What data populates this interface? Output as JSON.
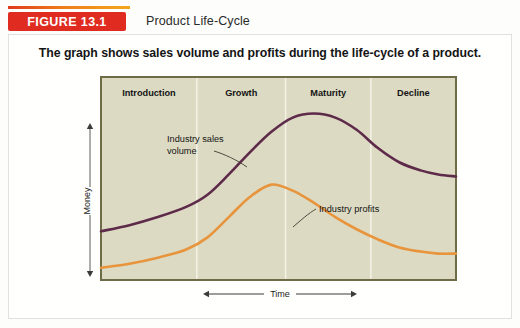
{
  "header": {
    "badge_label": "FIGURE 13.1",
    "title": "Product Life-Cycle",
    "badge_color": "#e02b20",
    "rule_color": "#ef7d1a"
  },
  "caption": "The graph shows sales volume and profits during the life-cycle of a product.",
  "axes": {
    "y_label": "Money",
    "x_label": "Time"
  },
  "annotations": {
    "sales_line1": "Industry sales",
    "sales_line2": "volume",
    "profits": "Industry profits"
  },
  "chart_data": {
    "type": "line",
    "title": "Product Life-Cycle",
    "subtitle": "The graph shows sales volume and profits during the life-cycle of a product.",
    "xlabel": "Time",
    "ylabel": "Money",
    "grid": false,
    "legend": "annotated-inline",
    "plot_background": "#dcdac2",
    "plot_border": "#6f6b46",
    "divider_color": "#f2f1e3",
    "xlim": [
      0,
      100
    ],
    "ylim": [
      0,
      100
    ],
    "stages": [
      {
        "label": "Introduction",
        "x_start": 0,
        "x_end": 27,
        "center": 13.5
      },
      {
        "label": "Growth",
        "x_start": 27,
        "x_end": 52,
        "center": 39.5
      },
      {
        "label": "Maturity",
        "x_start": 52,
        "x_end": 76,
        "center": 64.0
      },
      {
        "label": "Decline",
        "x_start": 76,
        "x_end": 100,
        "center": 88.0
      }
    ],
    "series": [
      {
        "name": "Industry sales volume",
        "color": "#5e2a4a",
        "x": [
          0,
          8,
          16,
          24,
          30,
          36,
          42,
          48,
          54,
          60,
          66,
          72,
          78,
          84,
          90,
          95,
          100
        ],
        "values": [
          24,
          27,
          31,
          36,
          42,
          52,
          63,
          73,
          80,
          82,
          80,
          74,
          65,
          58,
          54,
          52,
          51
        ]
      },
      {
        "name": "Industry profits",
        "color": "#e8943c",
        "x": [
          0,
          8,
          16,
          24,
          30,
          36,
          42,
          48,
          54,
          60,
          66,
          72,
          78,
          84,
          90,
          95,
          100
        ],
        "values": [
          6,
          8,
          11,
          15,
          21,
          31,
          41,
          47,
          44,
          38,
          31,
          25,
          20,
          16,
          14,
          13,
          13
        ]
      }
    ]
  }
}
